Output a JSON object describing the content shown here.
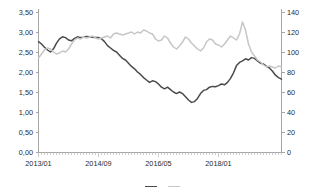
{
  "chart_data": {
    "type": "line",
    "title": "",
    "subtitle": "",
    "xlabel": "",
    "ylabel": "",
    "y2label": "",
    "grid": false,
    "legend_position": "bottom",
    "x_tick_labels": [
      "2013/01",
      "2014/09",
      "2016/05",
      "2018/01"
    ],
    "x_tick_indices": [
      0,
      20,
      40,
      60
    ],
    "x_minor_tick_interval_months": 1,
    "x_range_months": [
      0,
      72
    ],
    "left_axis": {
      "ticks": [
        "0,00",
        "0,50",
        "1,00",
        "1,50",
        "2,00",
        "2,50",
        "3,00",
        "3,50"
      ],
      "values": [
        0.0,
        0.5,
        1.0,
        1.5,
        2.0,
        2.5,
        3.0,
        3.5
      ],
      "ylim": [
        0.0,
        3.5
      ],
      "decimal_separator": ","
    },
    "right_axis": {
      "ticks": [
        "0",
        "20",
        "40",
        "60",
        "80",
        "100",
        "120",
        "140"
      ],
      "values": [
        0,
        20,
        40,
        60,
        80,
        100,
        120,
        140
      ],
      "ylim": [
        0,
        140
      ]
    },
    "series": [
      {
        "name": "series-dark",
        "axis": "left",
        "color": "#4a4a4a",
        "values": [
          2.76,
          2.7,
          2.62,
          2.55,
          2.5,
          2.58,
          2.72,
          2.83,
          2.88,
          2.86,
          2.8,
          2.78,
          2.84,
          2.88,
          2.86,
          2.87,
          2.89,
          2.88,
          2.87,
          2.86,
          2.86,
          2.83,
          2.76,
          2.66,
          2.6,
          2.54,
          2.5,
          2.42,
          2.34,
          2.3,
          2.22,
          2.14,
          2.08,
          2.0,
          1.94,
          1.86,
          1.8,
          1.74,
          1.78,
          1.76,
          1.7,
          1.62,
          1.58,
          1.62,
          1.56,
          1.5,
          1.46,
          1.5,
          1.46,
          1.38,
          1.3,
          1.24,
          1.26,
          1.34,
          1.46,
          1.54,
          1.56,
          1.62,
          1.64,
          1.63,
          1.66,
          1.7,
          1.68,
          1.74,
          1.84,
          1.98,
          2.16,
          2.24,
          2.28,
          2.33,
          2.3,
          2.36,
          2.34,
          2.28,
          2.22,
          2.2,
          2.14,
          2.1,
          2.02,
          1.92,
          1.86,
          1.82
        ]
      },
      {
        "name": "series-light",
        "axis": "right",
        "color": "#c6c6c6",
        "values": [
          94,
          98,
          102,
          104,
          103,
          100,
          98,
          99,
          101,
          100,
          103,
          108,
          112,
          114,
          113,
          115,
          114,
          115,
          116,
          114,
          113,
          114,
          115,
          116,
          114,
          118,
          119,
          118,
          117,
          118,
          119,
          120,
          118,
          120,
          119,
          122,
          121,
          119,
          118,
          113,
          111,
          112,
          116,
          114,
          109,
          105,
          103,
          106,
          110,
          115,
          113,
          109,
          106,
          103,
          101,
          104,
          110,
          113,
          112,
          108,
          107,
          105,
          108,
          112,
          116,
          114,
          112,
          118,
          130,
          122,
          108,
          100,
          96,
          92,
          90,
          87,
          85,
          86,
          85,
          84,
          86,
          85
        ]
      }
    ],
    "annotations": []
  },
  "legend": {
    "clipped": true,
    "entries": [
      {
        "label": "",
        "color": "#4a4a4a"
      },
      {
        "label": "",
        "color": "#c6c6c6"
      }
    ]
  }
}
